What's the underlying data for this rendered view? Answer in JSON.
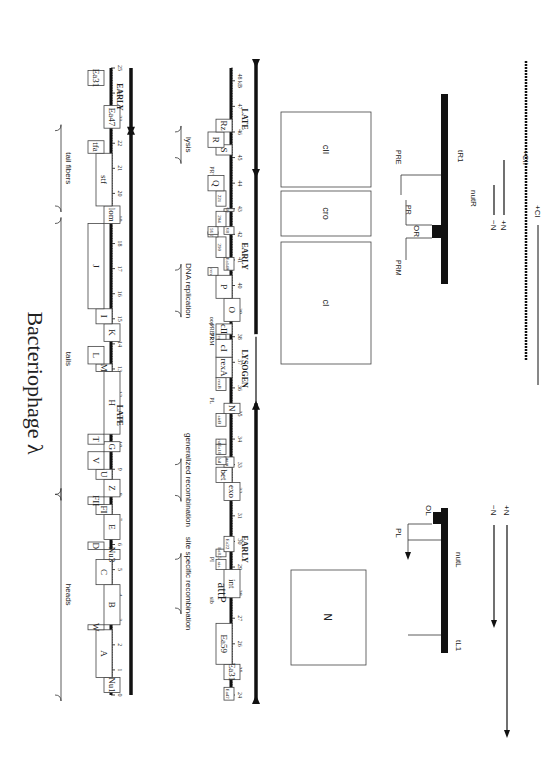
{
  "title": "Bacteriophage λ",
  "upper_map": {
    "groups": [
      {
        "label": "heads",
        "from": 0,
        "to": 8
      },
      {
        "label": "tails",
        "from": 8,
        "to": 18.8
      },
      {
        "label": "tail fibers",
        "from": 19.5,
        "to": 22.5
      }
    ],
    "genes": [
      {
        "label": "Nu1",
        "from": 0.1,
        "to": 0.7,
        "row": 1
      },
      {
        "label": "A",
        "from": 0.7,
        "to": 2.6,
        "row": 0
      },
      {
        "label": "W",
        "from": 2.6,
        "to": 2.8,
        "row": -1
      },
      {
        "label": "B",
        "from": 2.8,
        "to": 4.4,
        "row": 1
      },
      {
        "label": "C",
        "from": 4.4,
        "to": 5.4,
        "row": 0
      },
      {
        "label": "Nu3",
        "from": 5.4,
        "to": 5.8,
        "row": 1
      },
      {
        "label": "D",
        "from": 5.8,
        "to": 6.1,
        "row": -1
      },
      {
        "label": "E",
        "from": 6.2,
        "to": 7.2,
        "row": 1
      },
      {
        "label": "FI",
        "from": 7.2,
        "to": 7.6,
        "row": 0
      },
      {
        "label": "FII",
        "from": 7.6,
        "to": 7.9,
        "row": -1
      },
      {
        "label": "Z",
        "from": 7.9,
        "to": 8.6,
        "row": 1
      },
      {
        "label": "U",
        "from": 8.6,
        "to": 9.0,
        "row": 0
      },
      {
        "label": "V",
        "from": 9.0,
        "to": 9.7,
        "row": -1
      },
      {
        "label": "G",
        "from": 9.7,
        "to": 10.1,
        "row": 1
      },
      {
        "label": "T",
        "from": 10.0,
        "to": 10.4,
        "row": -1
      },
      {
        "label": "H",
        "from": 10.4,
        "to": 12.9,
        "row": 1
      },
      {
        "label": "M",
        "from": 12.9,
        "to": 13.2,
        "row": 0
      },
      {
        "label": "L",
        "from": 13.2,
        "to": 13.9,
        "row": -1
      },
      {
        "label": "K",
        "from": 14.1,
        "to": 14.8,
        "row": 1
      },
      {
        "label": "I",
        "from": 14.8,
        "to": 15.4,
        "row": 0
      },
      {
        "label": "J",
        "from": 15.4,
        "to": 18.8,
        "row": -1
      },
      {
        "label": "lom",
        "from": 18.8,
        "to": 19.5,
        "row": 1
      },
      {
        "label": "stf",
        "from": 19.5,
        "to": 21.6,
        "row": 0
      },
      {
        "label": "tfa",
        "from": 21.6,
        "to": 22.1,
        "row": -1
      },
      {
        "label": "Ea47",
        "from": 22.6,
        "to": 23.5,
        "row": 1
      },
      {
        "label": "Ea31",
        "from": 24.3,
        "to": 24.9,
        "row": -1
      }
    ],
    "ruler": {
      "min": 0,
      "max": 25,
      "ticks": [
        "0",
        "1",
        "2",
        "3",
        "4",
        "5",
        "6",
        "7",
        "8",
        "9",
        "10",
        "11",
        "12",
        "13",
        "14",
        "15",
        "16",
        "17",
        "18",
        "19",
        "20",
        "21",
        "22",
        "23",
        "24",
        "25"
      ]
    },
    "transcripts": [
      {
        "label": "LATE",
        "from": 0,
        "to": 22.3,
        "direction": "right"
      },
      {
        "label": "EARLY",
        "from": 22.7,
        "to": 25,
        "direction": "left"
      }
    ]
  },
  "lower_map": {
    "groups": [
      {
        "label": "site specific recombination",
        "from": 27.4,
        "to": 29.3
      },
      {
        "label": "generalized recombination",
        "from": 31.8,
        "to": 33.0
      },
      {
        "label": "DNA replication",
        "from": 39.0,
        "to": 40.6
      },
      {
        "label": "lysis",
        "from": 45.0,
        "to": 46.0
      }
    ],
    "genes": [
      {
        "label": "Ea47",
        "from": 23.8,
        "to": 24.3,
        "row": 1,
        "small": true
      },
      {
        "label": "Ea31",
        "from": 24.6,
        "to": 25.2,
        "row": 1
      },
      {
        "label": "Ea59",
        "from": 25.2,
        "to": 26.8,
        "row": 0
      },
      {
        "label": "int",
        "from": 27.8,
        "to": 28.9,
        "row": 1
      },
      {
        "label": "xis",
        "from": 28.9,
        "to": 29.3,
        "row": 0,
        "small": true
      },
      {
        "label": "Ea8.5",
        "from": 29.4,
        "to": 29.7,
        "row": 0,
        "small": true
      },
      {
        "label": "Ea22",
        "from": 29.6,
        "to": 30.2,
        "row": 1,
        "small": true
      },
      {
        "label": "exo",
        "from": 31.6,
        "to": 32.3,
        "row": 1
      },
      {
        "label": "bet",
        "from": 32.3,
        "to": 32.9,
        "row": 0
      },
      {
        "label": "gam",
        "from": 32.9,
        "to": 33.3,
        "row": 1,
        "small": true
      },
      {
        "label": "kil",
        "from": 33.0,
        "to": 33.3,
        "row": 0,
        "small": true
      },
      {
        "label": "Ea10",
        "from": 33.4,
        "to": 33.8,
        "row": 0,
        "small": true
      },
      {
        "label": "ral",
        "from": 33.8,
        "to": 34.0,
        "row": 0,
        "small": true
      },
      {
        "label": "sieB",
        "from": 34.5,
        "to": 35.0,
        "row": 0,
        "small": true
      },
      {
        "label": "N",
        "from": 35.0,
        "to": 35.4,
        "row": 1
      },
      {
        "label": "rexB",
        "from": 35.9,
        "to": 36.4,
        "row": 0,
        "small": true
      },
      {
        "label": "rexA",
        "from": 36.4,
        "to": 37.2,
        "row": 0
      },
      {
        "label": "cI",
        "from": 37.2,
        "to": 37.9,
        "row": 0
      },
      {
        "label": "cro",
        "from": 37.9,
        "to": 38.1,
        "row": 0,
        "small": true
      },
      {
        "label": "cII",
        "from": 38.1,
        "to": 38.5,
        "row": 0
      },
      {
        "label": "O",
        "from": 38.6,
        "to": 39.5,
        "row": 1
      },
      {
        "label": "P",
        "from": 39.5,
        "to": 40.4,
        "row": 0
      },
      {
        "label": "ren",
        "from": 40.4,
        "to": 40.7,
        "row": -1,
        "small": true
      },
      {
        "label": "Ea140",
        "from": 40.6,
        "to": 41.1,
        "row": 1,
        "small": true
      },
      {
        "label": "290",
        "from": 41.1,
        "to": 41.9,
        "row": 0,
        "small": true
      },
      {
        "label": "57",
        "from": 41.9,
        "to": 42.1,
        "row": -1,
        "small": true
      },
      {
        "label": "56",
        "from": 42.0,
        "to": 42.3,
        "row": -1,
        "small": true
      },
      {
        "label": "68",
        "from": 42.0,
        "to": 42.3,
        "row": 1,
        "small": true
      },
      {
        "label": "204",
        "from": 42.3,
        "to": 42.9,
        "row": 0,
        "small": true
      },
      {
        "label": "60",
        "from": 42.9,
        "to": 43.0,
        "row": 1,
        "small": true
      },
      {
        "label": "221",
        "from": 43.1,
        "to": 43.7,
        "row": 0,
        "small": true
      },
      {
        "label": "Q",
        "from": 43.7,
        "to": 44.3,
        "row": -1
      },
      {
        "label": "S",
        "from": 45.1,
        "to": 45.5,
        "row": 0
      },
      {
        "label": "R",
        "from": 45.4,
        "to": 46.0,
        "row": -1
      },
      {
        "label": "Rz",
        "from": 46.0,
        "to": 46.5,
        "row": 0
      }
    ],
    "markers": [
      {
        "label": "attP",
        "pos": 28.0,
        "large": true
      },
      {
        "label": "sib",
        "pos": 27.7
      },
      {
        "label": "PI",
        "pos": 29.3
      },
      {
        "label": "PL",
        "pos": 35.5
      },
      {
        "label": "PRM",
        "pos": 37.9
      },
      {
        "label": "PR",
        "pos": 38.0
      },
      {
        "label": "PRE",
        "pos": 38.3
      },
      {
        "label": "oop",
        "pos": 38.6
      },
      {
        "label": "PR'",
        "pos": 44.5
      }
    ],
    "ruler": {
      "min": 24,
      "max": 48.5,
      "ticks": [
        "24",
        "25",
        "26",
        "27",
        "28",
        "29",
        "30",
        "31",
        "32",
        "33",
        "34",
        "35",
        "36",
        "37",
        "38",
        "39",
        "40",
        "41",
        "42",
        "43",
        "44",
        "45",
        "46",
        "47",
        "48 kB"
      ]
    },
    "transcripts": [
      {
        "label": "EARLY",
        "from": 24,
        "to": 35.4,
        "direction": "left"
      },
      {
        "label": "LYSOGEN",
        "from": 35.5,
        "to": 38.0,
        "direction": "left",
        "thin": true
      },
      {
        "label": "EARLY",
        "from": 38.1,
        "to": 44.2,
        "direction": "right"
      },
      {
        "label": "LATE",
        "from": 44.5,
        "to": 48.5,
        "direction": "right"
      }
    ]
  },
  "regulation_left": {
    "box_label": "N",
    "promoter": "PL",
    "operator": "OL",
    "sites": [
      "nutL",
      "tL1"
    ],
    "arrows": [
      {
        "label": "−N"
      },
      {
        "label": "+N"
      }
    ]
  },
  "regulation_right": {
    "boxes": [
      "cI",
      "cro",
      "cII"
    ],
    "promoters": [
      "PRM",
      "PR",
      "PRE"
    ],
    "operator": "OR",
    "sites": [
      "nutR",
      "tR1"
    ],
    "arrows": [
      {
        "label": "−N"
      },
      {
        "label": "+N"
      },
      {
        "label": "+CII"
      },
      {
        "label": "+CI"
      }
    ]
  }
}
